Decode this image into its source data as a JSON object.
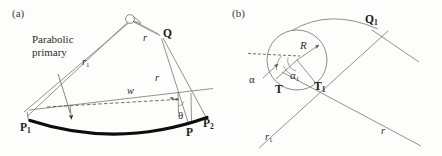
{
  "figure": {
    "background_color": "#fdfdfc",
    "line_color": "#6e6e6e",
    "curve_color": "#0d0d0d",
    "text_color": "#2b2b2b"
  },
  "panel_a": {
    "tag": "(a)",
    "annotation": {
      "line1": "Parabolic",
      "line2": "primary"
    },
    "labels": {
      "Q": "Q",
      "P1": "P",
      "P1_sub": "1",
      "P": "P",
      "P2": "P",
      "P2_sub": "2",
      "r1": "r",
      "r1_sub": "1",
      "r_upper": "r",
      "r_lower": "r",
      "w": "w",
      "theta": "θ"
    },
    "icons": {
      "apex_marker": "secondary-mirror-circle",
      "pointer": "annotation-arrow"
    }
  },
  "panel_b": {
    "tag": "(b)",
    "labels": {
      "Q1": "Q",
      "Q1_sub": "1",
      "R": "R",
      "alpha": "α",
      "alpha1": "α",
      "alpha1_sub": "1",
      "T": "T",
      "T1": "T",
      "T1_sub": "1",
      "r1": "r",
      "r1_sub": "1",
      "r": "r"
    },
    "icons": {
      "radius_arrow": "radius-arrow",
      "alpha_arrow": "alpha-pointer-arrow",
      "circle": "tangent-circle"
    }
  }
}
